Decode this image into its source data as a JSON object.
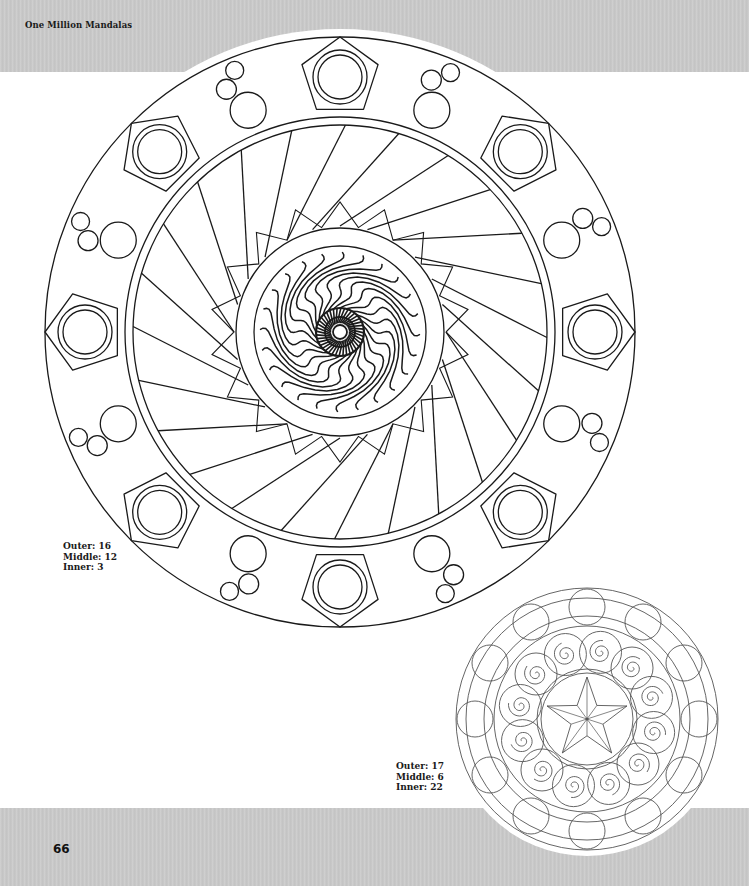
{
  "page": {
    "running_head": "One Million Mandalas",
    "page_number": "66",
    "band_color": "#c9c9c9",
    "line_color": "#1a1a1a",
    "small_line_color": "#555555"
  },
  "mandalas": [
    {
      "id": "large",
      "center": [
        340,
        332
      ],
      "outer_radius": 295,
      "halo_radius": 303,
      "caption": {
        "outer": "Outer: 16",
        "middle": "Middle: 12",
        "inner": "Inner: 3"
      },
      "outer_ring": {
        "pentagons": 8,
        "circle_trios": 8,
        "band_inner": 207,
        "band_outer": 215
      },
      "middle_ring": {
        "blades": 12,
        "inner_band_outer": 104,
        "inner_band_inner": 86
      },
      "inner_ring": {
        "swirl_radius": 80,
        "core_radius": 24,
        "hole_radius": 7,
        "waves": 24
      }
    },
    {
      "id": "small",
      "center": [
        587,
        719
      ],
      "outer_radius": 131,
      "caption": {
        "outer": "Outer: 17",
        "middle": "Middle: 6",
        "inner": "Inner: 22"
      },
      "outer_ring": {
        "circles": 12,
        "circle_radius": 18
      },
      "middle_ring": {
        "swirls": 12
      },
      "inner_ring": {
        "star_points": 5,
        "circle_radius": 46
      }
    }
  ]
}
